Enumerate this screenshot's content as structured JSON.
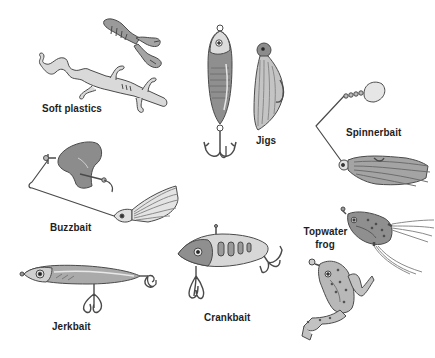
{
  "illustration": {
    "background": "#ffffff",
    "ink_color": "#4a4a4a",
    "fill_dark": "#8c8c8c",
    "fill_mid": "#a8a8a8",
    "fill_light": "#c9c9c9",
    "fill_pale": "#e2e2e2",
    "lures": [
      {
        "id": "soft-plastics",
        "label": "Soft plastics",
        "icon": "soft-plastic-lizard-and-crawfish-icon"
      },
      {
        "id": "jigs",
        "label": "Jigs",
        "icon": "jig-spoon-and-skirted-jig-icon"
      },
      {
        "id": "spinnerbait",
        "label": "Spinnerbait",
        "icon": "spinnerbait-icon"
      },
      {
        "id": "buzzbait",
        "label": "Buzzbait",
        "icon": "buzzbait-icon"
      },
      {
        "id": "topwater-frog",
        "label_line1": "Topwater",
        "label_line2": "frog",
        "icon": "topwater-frog-icon"
      },
      {
        "id": "crankbait",
        "label": "Crankbait",
        "icon": "crankbait-icon"
      },
      {
        "id": "jerkbait",
        "label": "Jerkbait",
        "icon": "jerkbait-icon"
      }
    ]
  }
}
